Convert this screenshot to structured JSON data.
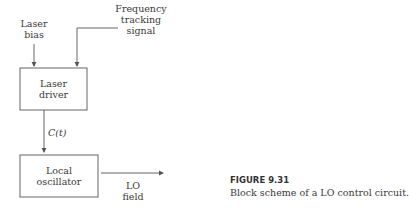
{
  "inputs": {
    "laser_bias": [
      "Laser",
      "bias"
    ],
    "frequency_tracking": [
      "Frequency",
      "tracking",
      "signal"
    ]
  },
  "blocks": {
    "laser_driver": [
      "Laser",
      "driver"
    ],
    "local_oscillator": [
      "Local",
      "oscillator"
    ]
  },
  "signals": {
    "control": "C(t)",
    "output": [
      "LO",
      "field"
    ]
  },
  "caption": {
    "title": "FIGURE 9.31",
    "text": "Block scheme of a LO control circuit."
  },
  "colors": {
    "line": "#555555",
    "text": "#3a3a3a"
  }
}
